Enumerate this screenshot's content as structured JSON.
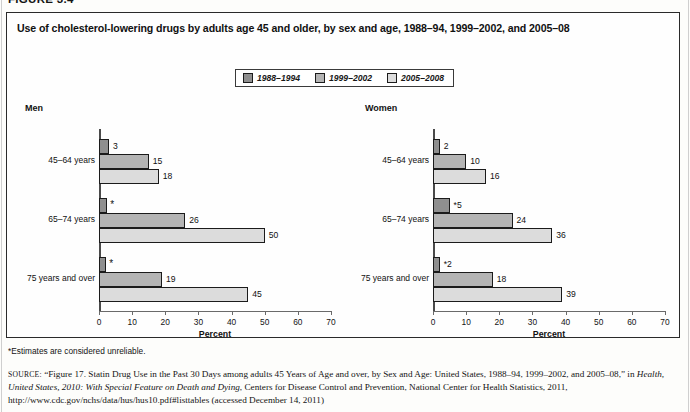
{
  "figure": {
    "number_label": "FIGURE 3.4",
    "title": "Use of cholesterol-lowering drugs by adults age 45 and older, by sex and age, 1988–94, 1999–2002, and 2005–08",
    "footnote": "*Estimates are considered unreliable.",
    "source_prefix": "SOURCE:",
    "source_quote": "“Figure 17. Statin Drug Use in the Past 30 Days among adults 45 Years of Age and over, by Sex and Age: United States, 1988–94, 1999–2002, and 2005–08,” in ",
    "source_italic": "Health, United States, 2010: With Special Feature on Death and Dying",
    "source_suffix": ", Centers for Disease Control and Prevention, National Center for Health Statistics, 2011, http://www.cdc.gov/nchs/data/hus/hus10.pdf#listtables (accessed December 14, 2011)"
  },
  "legend": {
    "items": [
      {
        "label": "1988–1994",
        "color": "#8f8f8f"
      },
      {
        "label": "1999–2002",
        "color": "#b4b4b4"
      },
      {
        "label": "2005–2008",
        "color": "#dcdcdc"
      }
    ]
  },
  "chart_data": {
    "type": "bar",
    "orientation": "horizontal",
    "title": "Use of cholesterol-lowering drugs by adults age 45 and older, by sex and age, 1988–94, 1999–2002, and 2005–08",
    "xlabel": "Percent",
    "ylabel": "",
    "xlim": [
      0,
      70
    ],
    "xticks": [
      0,
      10,
      20,
      30,
      40,
      50,
      60,
      70
    ],
    "grid": false,
    "legend_position": "top-center",
    "series_names": [
      "1988–1994",
      "1999–2002",
      "2005–2008"
    ],
    "categories": [
      "45–64 years",
      "65–74 years",
      "75 years and over"
    ],
    "panels": [
      {
        "name": "Men",
        "series": [
          {
            "name": "1988–1994",
            "values": [
              3,
              2.5,
              2.2
            ],
            "labels": [
              "3",
              "*",
              "*"
            ],
            "unreliable": [
              false,
              true,
              true
            ]
          },
          {
            "name": "1999–2002",
            "values": [
              15,
              26,
              19
            ],
            "labels": [
              "15",
              "26",
              "19"
            ],
            "unreliable": [
              false,
              false,
              false
            ]
          },
          {
            "name": "2005–2008",
            "values": [
              18,
              50,
              45
            ],
            "labels": [
              "18",
              "50",
              "45"
            ],
            "unreliable": [
              false,
              false,
              false
            ]
          }
        ]
      },
      {
        "name": "Women",
        "series": [
          {
            "name": "1988–1994",
            "values": [
              2,
              5,
              2
            ],
            "labels": [
              "2",
              "*5",
              "*2"
            ],
            "unreliable": [
              false,
              true,
              true
            ]
          },
          {
            "name": "1999–2002",
            "values": [
              10,
              24,
              18
            ],
            "labels": [
              "10",
              "24",
              "18"
            ],
            "unreliable": [
              false,
              false,
              false
            ]
          },
          {
            "name": "2005–2008",
            "values": [
              16,
              36,
              39
            ],
            "labels": [
              "16",
              "36",
              "39"
            ],
            "unreliable": [
              false,
              false,
              false
            ]
          }
        ]
      }
    ]
  }
}
